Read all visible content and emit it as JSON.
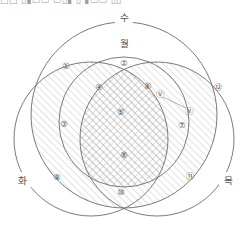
{
  "header": {
    "clipped_text": "□□ ▯▮▭▭ ▭▯▮ ▯ ▮▭▭ ▯▯"
  },
  "diagram": {
    "type": "four-set-venn",
    "set_labels": [
      {
        "id": "su",
        "text": "수",
        "x": 124,
        "y": 17,
        "circle": "top-large"
      },
      {
        "id": "wol",
        "text": "월",
        "x": 124,
        "y": 43,
        "circle": "top-inner"
      },
      {
        "id": "hwa",
        "text": "화",
        "x": 22,
        "y": 180,
        "circle": "left"
      },
      {
        "id": "mok",
        "text": "목",
        "x": 228,
        "y": 180,
        "circle": "right"
      }
    ],
    "circles": [
      {
        "id": "top-large",
        "cx": 124,
        "cy": 115,
        "r": 93
      },
      {
        "id": "top-inner",
        "cx": 124,
        "cy": 122,
        "r": 65
      },
      {
        "id": "left",
        "cx": 91,
        "cy": 139,
        "r": 77
      },
      {
        "id": "right",
        "cx": 157,
        "cy": 139,
        "r": 77
      }
    ],
    "regions": [
      {
        "num": "①",
        "x": 66,
        "y": 66
      },
      {
        "num": "②",
        "x": 124,
        "y": 63
      },
      {
        "num": "③",
        "x": 64,
        "y": 124
      },
      {
        "num": "④",
        "x": 99,
        "y": 87
      },
      {
        "num": "⑤",
        "x": 121,
        "y": 112
      },
      {
        "num": "⑥",
        "x": 148,
        "y": 86
      },
      {
        "num": "⑦",
        "x": 182,
        "y": 125
      },
      {
        "num": "⑧",
        "x": 124,
        "y": 155
      },
      {
        "num": "⑨",
        "x": 57,
        "y": 177
      },
      {
        "num": "⑩",
        "x": 121,
        "y": 192
      },
      {
        "num": "⑪",
        "x": 190,
        "y": 176
      },
      {
        "num": "⑫",
        "x": 218,
        "y": 87
      }
    ],
    "callout": {
      "start_marker": "Ⓥ",
      "start_x": 160,
      "start_y": 94,
      "end_marker": "Ⓥ",
      "end_x": 189,
      "end_y": 111
    },
    "shading": {
      "diagonal_regions": [
        "③",
        "④",
        "⑥",
        "⑧"
      ],
      "crosshatch_regions": [
        "⑤"
      ],
      "hatch_direction": "up-right"
    },
    "colors": {
      "stroke": "#6b6b6b",
      "label": "#5a5a5a",
      "hatch": "#a9a9a9",
      "background": "#ffffff"
    }
  }
}
